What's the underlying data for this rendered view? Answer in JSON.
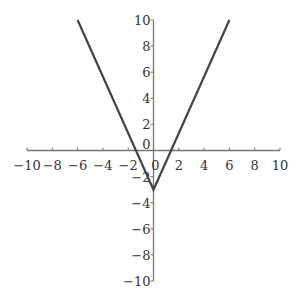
{
  "chart_data": {
    "type": "line",
    "title": "",
    "xlabel": "",
    "ylabel": "",
    "xlim": [
      -10,
      10
    ],
    "ylim": [
      -10,
      10
    ],
    "grid": false,
    "legend": null,
    "x_ticks": [
      -10,
      -8,
      -6,
      -4,
      -2,
      0,
      2,
      4,
      6,
      8,
      10
    ],
    "y_ticks": [
      -10,
      -8,
      -6,
      -4,
      -2,
      0,
      2,
      4,
      6,
      8,
      10
    ],
    "x_tick_labels": [
      "-10",
      "-8",
      "-6",
      "-4",
      "-2",
      "0",
      "2",
      "4",
      "6",
      "8",
      "10"
    ],
    "y_tick_labels": [
      "-10",
      "-8",
      "-6",
      "-4",
      "-2",
      "0",
      "2",
      "4",
      "6",
      "8",
      "10"
    ],
    "series": [
      {
        "name": "V-shaped absolute value function",
        "description": "y = (13/6)|x| - 3",
        "x": [
          -6,
          0,
          6
        ],
        "y": [
          10,
          -3,
          10
        ],
        "color": "#444444"
      }
    ],
    "annotations": {
      "vertex": [
        0,
        -3
      ],
      "x_intercepts": [
        -1.38,
        1.38
      ]
    }
  },
  "colors": {
    "axis": "#777777",
    "line": "#444444",
    "text": "#333333"
  }
}
